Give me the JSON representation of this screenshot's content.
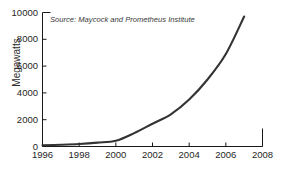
{
  "chart_data": {
    "type": "line",
    "title": "",
    "subtitle": "",
    "source_note": "Source: Maycock and Prometheus Institute",
    "xlabel": "",
    "ylabel": "Megawatts",
    "xlim": [
      1996,
      2008
    ],
    "ylim": [
      0,
      10000
    ],
    "xticks": [
      1996,
      1998,
      2000,
      2002,
      2004,
      2006,
      2008
    ],
    "yticks": [
      0,
      2000,
      4000,
      6000,
      8000,
      10000
    ],
    "grid": false,
    "legend": null,
    "line_color": "#333333",
    "x": [
      1996,
      1997,
      1998,
      1999,
      2000,
      2001,
      2002,
      2003,
      2004,
      2005,
      2006,
      2007
    ],
    "values": [
      90,
      130,
      190,
      290,
      430,
      1000,
      1700,
      2400,
      3500,
      5000,
      6900,
      9700
    ],
    "series": [
      {
        "name": "Global solar PV production",
        "values": [
          90,
          130,
          190,
          290,
          430,
          1000,
          1700,
          2400,
          3500,
          5000,
          6900,
          9700
        ]
      }
    ]
  },
  "axes": {
    "y_tick_labels": [
      "10000",
      "8000",
      "6000",
      "4000",
      "2000",
      "0"
    ],
    "x_tick_labels": [
      "1996",
      "1998",
      "2000",
      "2002",
      "2004",
      "2006",
      "2008"
    ],
    "y_axis_title": "Megawatts"
  },
  "annotations": {
    "source": "Source: Maycock and Prometheus Institute"
  }
}
